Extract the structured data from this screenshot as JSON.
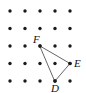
{
  "figure": {
    "type": "geometry-lattice-diagram",
    "width": 86,
    "height": 93,
    "background_color": "#ffffff",
    "dot_color": "#1a1a1a",
    "dot_radius": 1.7,
    "line_color": "#555555",
    "grid": {
      "columns": 5,
      "rows": 5,
      "x_origin": 10,
      "y_origin": 11,
      "x_spacing": 15,
      "y_spacing": 17.5,
      "points": [
        {
          "col": 0,
          "row": 0,
          "x": 10,
          "y": 11
        },
        {
          "col": 1,
          "row": 0,
          "x": 25,
          "y": 11
        },
        {
          "col": 2,
          "row": 0,
          "x": 40,
          "y": 11
        },
        {
          "col": 3,
          "row": 0,
          "x": 55,
          "y": 11
        },
        {
          "col": 4,
          "row": 0,
          "x": 70,
          "y": 11
        },
        {
          "col": 0,
          "row": 1,
          "x": 10,
          "y": 28.5
        },
        {
          "col": 1,
          "row": 1,
          "x": 25,
          "y": 28.5
        },
        {
          "col": 2,
          "row": 1,
          "x": 40,
          "y": 28.5
        },
        {
          "col": 3,
          "row": 1,
          "x": 55,
          "y": 28.5
        },
        {
          "col": 4,
          "row": 1,
          "x": 70,
          "y": 28.5
        },
        {
          "col": 0,
          "row": 2,
          "x": 10,
          "y": 46
        },
        {
          "col": 1,
          "row": 2,
          "x": 25,
          "y": 46
        },
        {
          "col": 2,
          "row": 2,
          "x": 40,
          "y": 46
        },
        {
          "col": 3,
          "row": 2,
          "x": 55,
          "y": 46
        },
        {
          "col": 4,
          "row": 2,
          "x": 70,
          "y": 46
        },
        {
          "col": 0,
          "row": 3,
          "x": 10,
          "y": 63.5
        },
        {
          "col": 1,
          "row": 3,
          "x": 25,
          "y": 63.5
        },
        {
          "col": 2,
          "row": 3,
          "x": 40,
          "y": 63.5
        },
        {
          "col": 3,
          "row": 3,
          "x": 55,
          "y": 63.5
        },
        {
          "col": 4,
          "row": 3,
          "x": 70,
          "y": 63.5
        },
        {
          "col": 0,
          "row": 4,
          "x": 10,
          "y": 81
        },
        {
          "col": 1,
          "row": 4,
          "x": 25,
          "y": 81
        },
        {
          "col": 2,
          "row": 4,
          "x": 40,
          "y": 81
        },
        {
          "col": 3,
          "row": 4,
          "x": 55,
          "y": 81
        },
        {
          "col": 4,
          "row": 4,
          "x": 70,
          "y": 81
        }
      ]
    },
    "triangle": {
      "name": "DEF",
      "path": "M 40 46 L 70 63.5 L 55 81 Z",
      "vertices": [
        {
          "label": "F",
          "x": 40,
          "y": 46,
          "grid_col": 2,
          "grid_row": 2,
          "label_x": 33,
          "label_y": 43
        },
        {
          "label": "E",
          "x": 70,
          "y": 63.5,
          "grid_col": 4,
          "grid_row": 3,
          "label_x": 74,
          "label_y": 67
        },
        {
          "label": "D",
          "x": 55,
          "y": 81,
          "grid_col": 3,
          "grid_row": 4,
          "label_x": 51,
          "label_y": 92
        }
      ]
    }
  }
}
